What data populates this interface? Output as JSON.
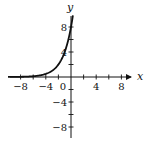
{
  "chart_data": {
    "type": "line",
    "title": "",
    "xlabel": "x",
    "ylabel": "y",
    "xlim": [
      -10,
      10
    ],
    "ylim": [
      -10,
      10
    ],
    "x_ticks": [
      -8,
      -4,
      0,
      4,
      8
    ],
    "x_tick_labels": [
      "-8",
      "-4",
      "0",
      "4",
      "8"
    ],
    "y_ticks": [
      8,
      4,
      -4,
      -8
    ],
    "y_tick_labels": [
      "8",
      "4",
      "-4",
      "-8"
    ],
    "minor_tick_step": 2,
    "grid": false,
    "legend": null,
    "series": [
      {
        "name": "exponential curve",
        "x": [
          -10,
          -8,
          -6,
          -4,
          -3,
          -2,
          -1,
          0,
          0.3
        ],
        "y": [
          0.008,
          0.03,
          0.125,
          0.5,
          1,
          2,
          4,
          8,
          9.85
        ]
      }
    ]
  }
}
